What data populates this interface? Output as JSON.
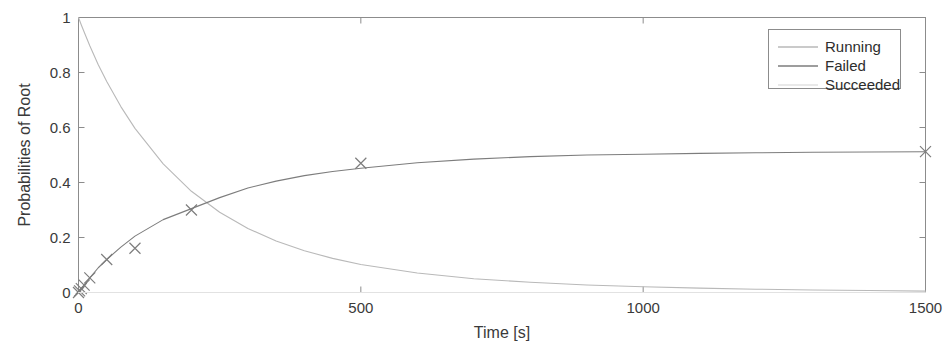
{
  "chart_data": {
    "type": "line",
    "title": "",
    "xlabel": "Time [s]",
    "ylabel": "Probabilities of Root",
    "xlim": [
      0,
      1500
    ],
    "ylim": [
      0,
      1
    ],
    "xticks": [
      0,
      500,
      1000,
      1500
    ],
    "xticklabels": [
      "0",
      "500",
      "1000",
      "1500"
    ],
    "yticks": [
      0,
      0.2,
      0.4,
      0.6,
      0.8,
      1
    ],
    "yticklabels": [
      "0",
      "0.2",
      "0.4",
      "0.6",
      "0.8",
      "1"
    ],
    "grid": false,
    "legend_position": "top-right",
    "series": [
      {
        "name": "Running",
        "color": "#b9b9b9",
        "marker": "none",
        "x": [
          0,
          2,
          5,
          10,
          20,
          35,
          50,
          75,
          100,
          150,
          200,
          250,
          300,
          350,
          400,
          450,
          500,
          600,
          700,
          800,
          900,
          1000,
          1100,
          1200,
          1300,
          1400,
          1500
        ],
        "y": [
          1.0,
          0.989,
          0.973,
          0.947,
          0.897,
          0.828,
          0.767,
          0.676,
          0.597,
          0.468,
          0.368,
          0.292,
          0.233,
          0.187,
          0.152,
          0.124,
          0.102,
          0.071,
          0.05,
          0.037,
          0.027,
          0.021,
          0.016,
          0.012,
          0.009,
          0.007,
          0.005
        ]
      },
      {
        "name": "Failed",
        "color": "#7d7d7d",
        "marker": "x",
        "x": [
          0,
          2,
          5,
          10,
          20,
          50,
          100,
          200,
          500,
          1500
        ],
        "y": [
          0.0,
          0.006,
          0.014,
          0.027,
          0.053,
          0.12,
          0.161,
          0.3,
          0.47,
          0.512
        ],
        "curve_x": [
          0,
          2,
          5,
          10,
          20,
          35,
          50,
          75,
          100,
          150,
          200,
          250,
          300,
          350,
          400,
          450,
          500,
          600,
          700,
          800,
          900,
          1000,
          1100,
          1200,
          1300,
          1400,
          1500
        ],
        "curve_y": [
          0.0,
          0.006,
          0.014,
          0.027,
          0.053,
          0.09,
          0.12,
          0.165,
          0.205,
          0.265,
          0.305,
          0.345,
          0.38,
          0.405,
          0.425,
          0.44,
          0.452,
          0.472,
          0.485,
          0.494,
          0.5,
          0.503,
          0.506,
          0.508,
          0.51,
          0.511,
          0.512
        ]
      },
      {
        "name": "Succeeded",
        "color": "#e2e2e2",
        "marker": "none",
        "x": [
          0,
          200,
          500,
          1000,
          1500
        ],
        "y": [
          0.0,
          0.0,
          0.0,
          0.0,
          0.0
        ]
      }
    ]
  },
  "legend": {
    "items": [
      {
        "label": "Running"
      },
      {
        "label": "Failed"
      },
      {
        "label": "Succeeded"
      }
    ]
  },
  "axes": {
    "x_title": "Time [s]",
    "y_title": "Probabilities of Root"
  }
}
